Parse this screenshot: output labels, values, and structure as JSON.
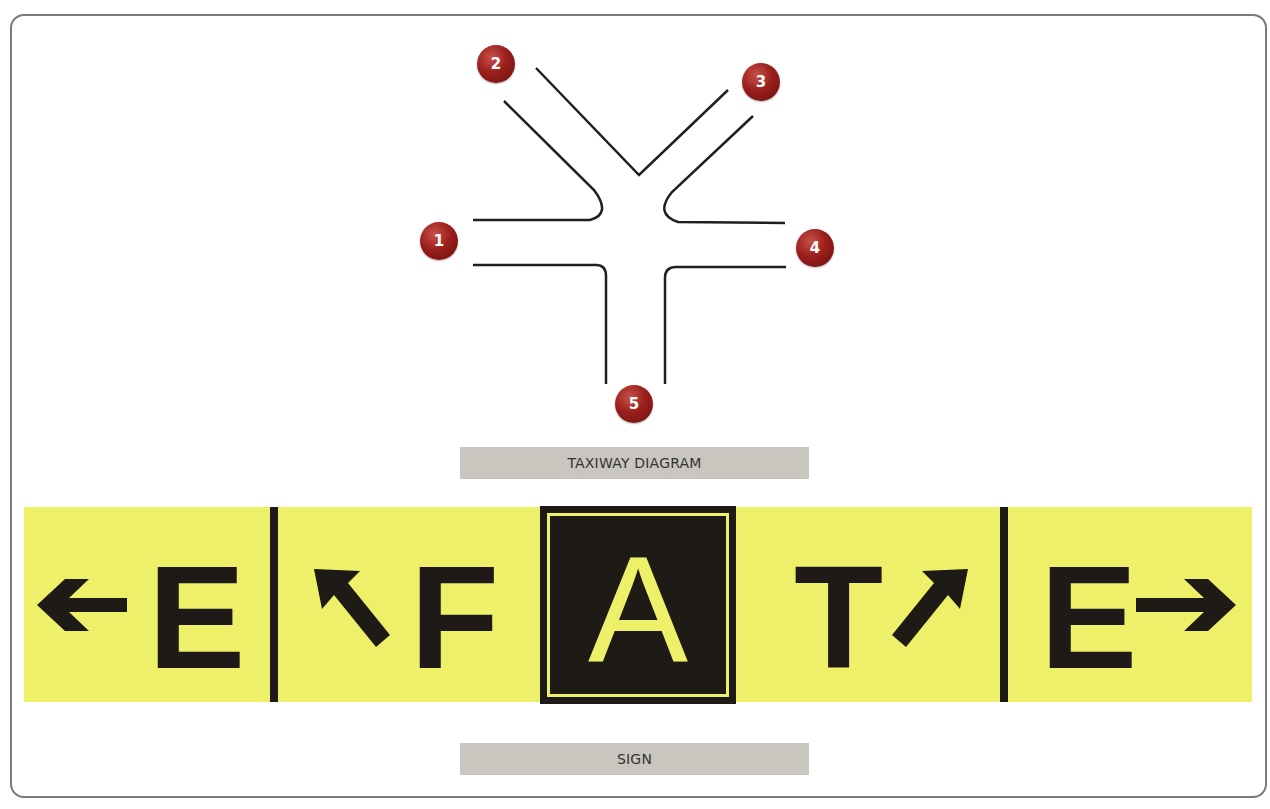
{
  "diagram": {
    "title": "TAXIWAY DIAGRAM",
    "badges": [
      {
        "id": "1",
        "label": "1"
      },
      {
        "id": "2",
        "label": "2"
      },
      {
        "id": "3",
        "label": "3"
      },
      {
        "id": "4",
        "label": "4"
      },
      {
        "id": "5",
        "label": "5"
      }
    ]
  },
  "sign": {
    "title": "SIGN",
    "background_color": "#eef06a",
    "text_color": "#1e1a16",
    "panels": [
      {
        "letter": "E",
        "arrow": "left-arrow"
      },
      {
        "letter": "F",
        "arrow": "up-left-arrow"
      },
      {
        "letter": "A",
        "type": "location",
        "arrow": ""
      },
      {
        "letter": "T",
        "arrow": "up-right-arrow"
      },
      {
        "letter": "E",
        "arrow": "right-arrow"
      }
    ]
  }
}
